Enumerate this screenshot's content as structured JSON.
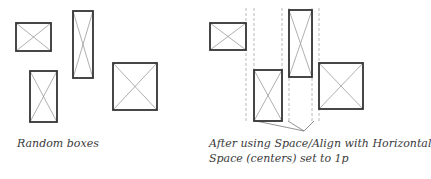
{
  "left_panel": {
    "caption": "Random boxes",
    "boxes": [
      {
        "x": 16,
        "y": 23,
        "w": 35,
        "h": 28
      },
      {
        "x": 73,
        "y": 11,
        "w": 20,
        "h": 67
      },
      {
        "x": 30,
        "y": 71,
        "w": 27,
        "h": 51
      },
      {
        "x": 113,
        "y": 63,
        "w": 44,
        "h": 47
      }
    ]
  },
  "right_panel": {
    "caption_line1": "After using Space/Align with Horizontal",
    "caption_line2": "Space (centers) set to 1p",
    "boxes": [
      {
        "x": 210,
        "y": 23,
        "w": 36,
        "h": 27
      },
      {
        "x": 254,
        "y": 70,
        "w": 28,
        "h": 51
      },
      {
        "x": 289,
        "y": 10,
        "w": 23,
        "h": 67
      },
      {
        "x": 319,
        "y": 63,
        "w": 44,
        "h": 46
      }
    ],
    "guide_lines_x": [
      246,
      254,
      282,
      289,
      312,
      319
    ],
    "leader_origin": {
      "x": 304,
      "y": 131
    },
    "leader_targets": [
      {
        "x": 256,
        "y": 121
      },
      {
        "x": 288,
        "y": 121
      },
      {
        "x": 314,
        "y": 121
      }
    ]
  },
  "colors": {
    "box_stroke": "#333333",
    "cross_stroke": "#9a9a9a",
    "guide": "#a8a8a8",
    "text": "#3a3a3a"
  }
}
